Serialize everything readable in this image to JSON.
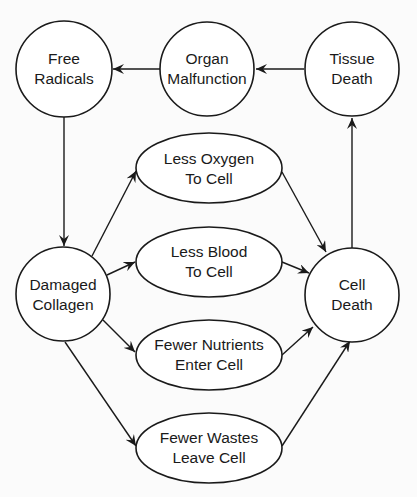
{
  "diagram": {
    "nodes": [
      {
        "id": "free-radicals",
        "shape": "circle",
        "lines": [
          "Free",
          "Radicals"
        ]
      },
      {
        "id": "organ-malfunction",
        "shape": "circle",
        "lines": [
          "Organ",
          "Malfunction"
        ]
      },
      {
        "id": "tissue-death",
        "shape": "circle",
        "lines": [
          "Tissue",
          "Death"
        ]
      },
      {
        "id": "damaged-collagen",
        "shape": "circle",
        "lines": [
          "Damaged",
          "Collagen"
        ]
      },
      {
        "id": "cell-death",
        "shape": "circle",
        "lines": [
          "Cell",
          "Death"
        ]
      },
      {
        "id": "less-oxygen",
        "shape": "ellipse",
        "lines": [
          "Less Oxygen",
          "To Cell"
        ]
      },
      {
        "id": "less-blood",
        "shape": "ellipse",
        "lines": [
          "Less Blood",
          "To Cell"
        ]
      },
      {
        "id": "fewer-nutrients",
        "shape": "ellipse",
        "lines": [
          "Fewer Nutrients",
          "Enter Cell"
        ]
      },
      {
        "id": "fewer-wastes",
        "shape": "ellipse",
        "lines": [
          "Fewer Wastes",
          "Leave Cell"
        ]
      }
    ],
    "edges": [
      {
        "from": "tissue-death",
        "to": "organ-malfunction"
      },
      {
        "from": "organ-malfunction",
        "to": "free-radicals"
      },
      {
        "from": "free-radicals",
        "to": "damaged-collagen"
      },
      {
        "from": "damaged-collagen",
        "to": "less-oxygen"
      },
      {
        "from": "damaged-collagen",
        "to": "less-blood"
      },
      {
        "from": "damaged-collagen",
        "to": "fewer-nutrients"
      },
      {
        "from": "damaged-collagen",
        "to": "fewer-wastes"
      },
      {
        "from": "less-oxygen",
        "to": "cell-death"
      },
      {
        "from": "less-blood",
        "to": "cell-death"
      },
      {
        "from": "fewer-nutrients",
        "to": "cell-death"
      },
      {
        "from": "fewer-wastes",
        "to": "cell-death"
      },
      {
        "from": "cell-death",
        "to": "tissue-death"
      }
    ]
  }
}
